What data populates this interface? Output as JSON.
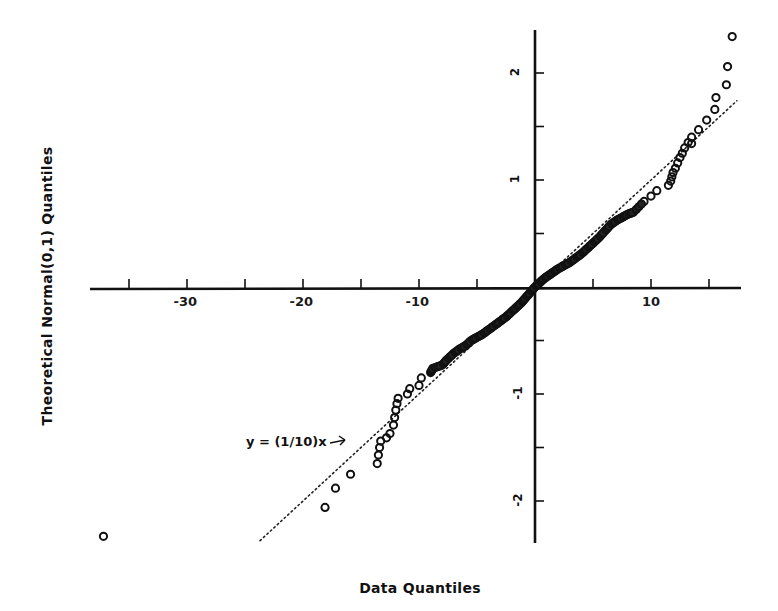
{
  "chart_data": {
    "type": "scatter",
    "title": "",
    "xlabel": "Data Quantiles",
    "ylabel": "Theoretical Normal(0,1) Quantiles",
    "xlim": [
      -38,
      17.8
    ],
    "ylim": [
      -2.4,
      2.4
    ],
    "x_ticks": [
      -35,
      -30,
      -25,
      -20,
      -15,
      -10,
      -5,
      0,
      5,
      10,
      15
    ],
    "x_tick_labels": {
      "-30": "-30",
      "-20": "-20",
      "-10": "-10",
      "10": "10"
    },
    "y_ticks": [
      -2,
      -1.5,
      -1,
      -0.5,
      0.5,
      1,
      1.5,
      2
    ],
    "y_tick_labels": {
      "-2": "-2",
      "-1": "-1",
      "1": "1",
      "2": "2"
    },
    "grid": false,
    "axes_through_origin": true,
    "reference_line": {
      "label": "y = (1/10)x",
      "slope": 0.1,
      "intercept": 0,
      "style": "dotted",
      "x_range": [
        -23.7,
        17.4
      ]
    },
    "annotation": {
      "text": "y = (1/10)x",
      "arrow_to": [
        -17.5,
        -1.45
      ]
    },
    "series": [
      {
        "name": "Q-Q points",
        "marker": "open-circle",
        "points": [
          [
            -37.2,
            -2.33
          ],
          [
            -18.1,
            -2.06
          ],
          [
            -17.2,
            -1.88
          ],
          [
            -15.9,
            -1.75
          ],
          [
            -13.6,
            -1.65
          ],
          [
            -13.5,
            -1.57
          ],
          [
            -13.4,
            -1.5
          ],
          [
            -13.3,
            -1.44
          ],
          [
            -12.8,
            -1.41
          ],
          [
            -12.5,
            -1.37
          ],
          [
            -12.2,
            -1.29
          ],
          [
            -12.1,
            -1.22
          ],
          [
            -12.0,
            -1.15
          ],
          [
            -11.9,
            -1.09
          ],
          [
            -11.8,
            -1.04
          ],
          [
            -11.0,
            -1.0
          ],
          [
            -10.8,
            -0.95
          ],
          [
            -10.0,
            -0.92
          ],
          [
            -9.8,
            -0.85
          ],
          [
            -9.0,
            -0.8
          ],
          [
            -8.8,
            -0.76
          ],
          [
            -8.0,
            -0.73
          ],
          [
            -7.6,
            -0.68
          ],
          [
            -7.0,
            -0.62
          ],
          [
            -6.5,
            -0.58
          ],
          [
            -6.0,
            -0.55
          ],
          [
            -5.5,
            -0.5
          ],
          [
            -5.0,
            -0.47
          ],
          [
            -4.5,
            -0.44
          ],
          [
            -4.0,
            -0.4
          ],
          [
            -3.5,
            -0.36
          ],
          [
            -3.0,
            -0.32
          ],
          [
            -2.5,
            -0.28
          ],
          [
            -2.0,
            -0.23
          ],
          [
            -1.6,
            -0.19
          ],
          [
            -1.2,
            -0.15
          ],
          [
            -0.8,
            -0.1
          ],
          [
            -0.4,
            -0.05
          ],
          [
            0.0,
            0.0
          ],
          [
            0.4,
            0.04
          ],
          [
            0.8,
            0.08
          ],
          [
            1.2,
            0.11
          ],
          [
            1.6,
            0.14
          ],
          [
            2.0,
            0.17
          ],
          [
            2.5,
            0.2
          ],
          [
            3.0,
            0.23
          ],
          [
            3.5,
            0.27
          ],
          [
            4.0,
            0.31
          ],
          [
            4.5,
            0.36
          ],
          [
            5.0,
            0.41
          ],
          [
            5.5,
            0.46
          ],
          [
            6.0,
            0.52
          ],
          [
            6.5,
            0.58
          ],
          [
            7.0,
            0.62
          ],
          [
            7.5,
            0.65
          ],
          [
            8.0,
            0.68
          ],
          [
            8.5,
            0.7
          ],
          [
            9.4,
            0.8
          ],
          [
            10.0,
            0.85
          ],
          [
            10.5,
            0.9
          ],
          [
            11.5,
            0.95
          ],
          [
            11.7,
            0.99
          ],
          [
            11.8,
            1.03
          ],
          [
            11.9,
            1.07
          ],
          [
            12.1,
            1.11
          ],
          [
            12.3,
            1.16
          ],
          [
            12.5,
            1.21
          ],
          [
            12.7,
            1.25
          ],
          [
            12.9,
            1.3
          ],
          [
            13.2,
            1.35
          ],
          [
            13.5,
            1.4
          ],
          [
            13.5,
            1.34
          ],
          [
            14.1,
            1.47
          ],
          [
            14.8,
            1.56
          ],
          [
            15.5,
            1.66
          ],
          [
            15.6,
            1.77
          ],
          [
            16.5,
            1.89
          ],
          [
            16.6,
            2.06
          ],
          [
            17.0,
            2.34
          ]
        ]
      }
    ]
  },
  "labels": {
    "x_title": "Data Quantiles",
    "y_title": "Theoretical Normal(0,1) Quantiles",
    "annotation": "y = (1/10)x"
  }
}
